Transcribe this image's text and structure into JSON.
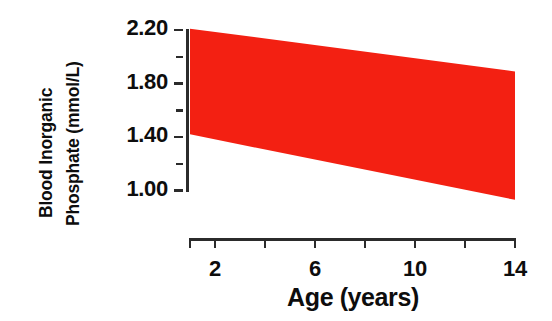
{
  "chart_data": {
    "type": "area",
    "title": "",
    "subtitle": "",
    "xlabel": "Age (years)",
    "ylabel_lines": [
      "Blood Inorganic",
      "Phosphate (mmol/L)"
    ],
    "ylabel": "Blood Inorganic Phosphate (mmol/L)",
    "x": [
      1,
      14
    ],
    "xlim": [
      1,
      14
    ],
    "ylim": [
      0.9,
      2.25
    ],
    "grid": false,
    "legend": null,
    "band_color": "#f32012",
    "axis_color": "#2b2b2b",
    "text_color": "#0d0d0d",
    "xticks": [
      2,
      4,
      6,
      8,
      10,
      12,
      14
    ],
    "xtick_labels": [
      "2",
      "",
      "6",
      "",
      "10",
      "",
      "14"
    ],
    "yticks": [
      1.0,
      1.2,
      1.4,
      1.6,
      1.8,
      2.0,
      2.2
    ],
    "ytick_labels": [
      "1.00",
      "",
      "1.40",
      "",
      "1.80",
      "",
      "2.20"
    ],
    "series": [
      {
        "name": "Upper reference limit",
        "x": [
          1,
          14
        ],
        "values": [
          2.21,
          1.89
        ]
      },
      {
        "name": "Lower reference limit",
        "x": [
          1,
          14
        ],
        "values": [
          1.42,
          0.93
        ]
      }
    ],
    "annotations": []
  },
  "axes": {
    "y_tick_labels": [
      {
        "value": "2.20",
        "v": 2.2
      },
      {
        "value": "1.80",
        "v": 1.8
      },
      {
        "value": "1.40",
        "v": 1.4
      },
      {
        "value": "1.00",
        "v": 1.0
      }
    ],
    "x_tick_labels": [
      {
        "value": "2",
        "v": 2
      },
      {
        "value": "6",
        "v": 6
      },
      {
        "value": "10",
        "v": 10
      },
      {
        "value": "14",
        "v": 14
      }
    ]
  }
}
